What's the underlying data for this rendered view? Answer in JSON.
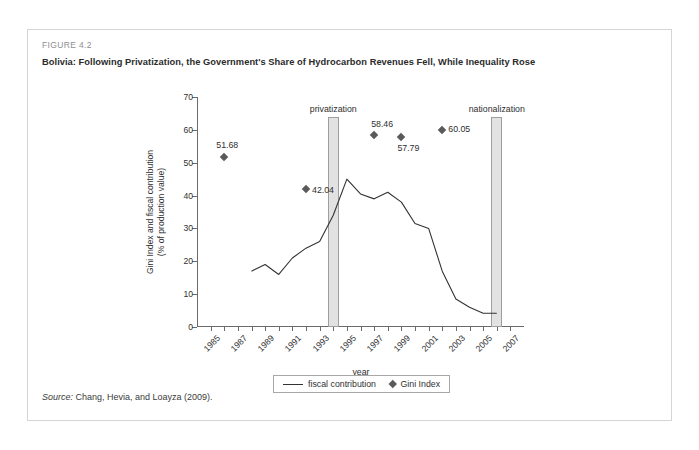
{
  "figure": {
    "label": "FIGURE 4.2",
    "title": "Bolivia: Following Privatization, the Government's Share of Hydrocarbon Revenues Fell, While Inequality Rose",
    "source_prefix": "Source:",
    "source_text": " Chang, Hevia, and Loayza (2009)."
  },
  "legend": {
    "line_label": "fiscal contribution",
    "marker_label": "Gini Index"
  },
  "annotations": {
    "privatization": "privatization",
    "nationalization": "nationalization"
  },
  "colors": {
    "line": "#333333",
    "marker": "#5a5a5a",
    "event_bar_fill": "#e2e2e2",
    "event_bar_stroke": "#9e9e9e",
    "axis": "#6b6b6b",
    "card_border": "#d5d5d5",
    "label_grey": "#8e8e8e"
  },
  "chart_data": {
    "type": "line",
    "title": "Bolivia: Following Privatization, the Government's Share of Hydrocarbon Revenues Fell, While Inequality Rose",
    "xlabel": "year",
    "ylabel": "Gini Index and fiscal contribution (% of production value)",
    "ylabel_line1": "Gini Index and fiscal contribution",
    "ylabel_line2": "(% of production value)",
    "xlim": [
      1984,
      2008
    ],
    "ylim": [
      0,
      70
    ],
    "yticks": [
      0,
      10,
      20,
      30,
      40,
      50,
      60,
      70
    ],
    "xticks": [
      1985,
      1987,
      1989,
      1991,
      1993,
      1995,
      1997,
      1999,
      2001,
      2003,
      2005,
      2007
    ],
    "grid": false,
    "legend_position": "bottom",
    "series": [
      {
        "name": "fiscal contribution",
        "type": "line",
        "x": [
          1988,
          1989,
          1990,
          1991,
          1992,
          1993,
          1994,
          1995,
          1996,
          1997,
          1998,
          1999,
          2000,
          2001,
          2002,
          2003,
          2004,
          2005,
          2006
        ],
        "values": [
          17.0,
          19.0,
          16.0,
          21.0,
          24.0,
          26.0,
          34.0,
          45.0,
          40.5,
          39.0,
          41.0,
          38.0,
          31.5,
          30.0,
          17.0,
          8.5,
          6.0,
          4.2,
          4.2
        ]
      },
      {
        "name": "Gini Index",
        "type": "scatter",
        "x": [
          1986,
          1992,
          1997,
          1999,
          2002
        ],
        "values": [
          51.68,
          42.04,
          58.46,
          57.79,
          60.05
        ],
        "point_labels": [
          "51.68",
          "42.04",
          "58.46",
          "57.79",
          "60.05"
        ]
      }
    ],
    "event_markers": [
      {
        "name": "privatization",
        "x": 1994,
        "label": "privatization",
        "top_value": 64
      },
      {
        "name": "nationalization",
        "x": 2006,
        "label": "nationalization",
        "top_value": 64
      }
    ]
  }
}
